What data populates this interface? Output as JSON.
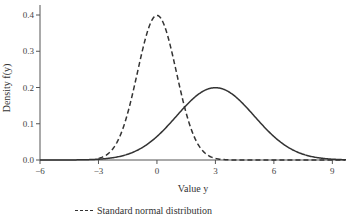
{
  "chart_data": {
    "type": "line",
    "title": "",
    "xlabel": "Value y",
    "ylabel": "Density f(y)",
    "xlim": [
      -6,
      9.7
    ],
    "ylim": [
      0,
      0.42
    ],
    "xticks": [
      -6,
      -3,
      0,
      3,
      6,
      9
    ],
    "xtick_labels": [
      "−6",
      "−3",
      "0",
      "3",
      "6",
      "9"
    ],
    "yticks": [
      0.0,
      0.1,
      0.2,
      0.3,
      0.4
    ],
    "ytick_labels": [
      "0.0",
      "0.1",
      "0.2",
      "0.3",
      "0.4"
    ],
    "grid": false,
    "legend_position": "bottom",
    "series": [
      {
        "name": "Standard normal distribution",
        "style": "dashed",
        "mean": 0,
        "sd": 1,
        "peak": 0.399,
        "x": [
          -6,
          -3,
          -2,
          -1,
          0,
          1,
          2,
          3,
          6,
          9
        ],
        "values": [
          0.0,
          0.004,
          0.054,
          0.242,
          0.399,
          0.242,
          0.054,
          0.004,
          0.0,
          0.0
        ]
      },
      {
        "name": "",
        "style": "solid",
        "mean": 3,
        "sd": 2,
        "peak": 0.199,
        "x": [
          -6,
          -3,
          -1,
          1,
          3,
          5,
          7,
          9
        ],
        "values": [
          0.0,
          0.002,
          0.027,
          0.121,
          0.199,
          0.121,
          0.027,
          0.002
        ]
      }
    ]
  },
  "legend": {
    "items": [
      {
        "label": "Standard normal distribution",
        "style": "dashed"
      }
    ]
  }
}
